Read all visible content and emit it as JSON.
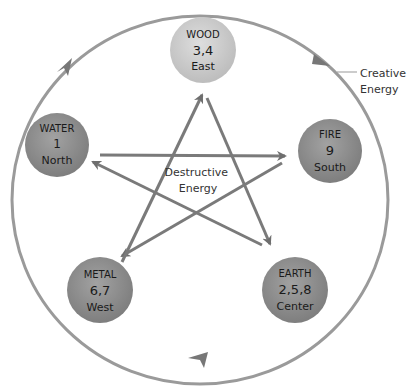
{
  "diagram": {
    "creative_label": [
      "Creative",
      "Energy"
    ],
    "destructive_label": [
      "Destructive",
      "Energy"
    ],
    "colors": {
      "outer_circle": "#8a8a8a",
      "arrows": "#7a7a7a",
      "wood_fill": "#cfcfcf",
      "other_fill": "#8f8f8f",
      "text": "#1a1a1a"
    },
    "elements": [
      {
        "name": "WOOD",
        "numbers": "3,4",
        "direction": "East"
      },
      {
        "name": "FIRE",
        "numbers": "9",
        "direction": "South"
      },
      {
        "name": "EARTH",
        "numbers": "2,5,8",
        "direction": "Center"
      },
      {
        "name": "METAL",
        "numbers": "6,7",
        "direction": "West"
      },
      {
        "name": "WATER",
        "numbers": "1",
        "direction": "North"
      }
    ]
  }
}
